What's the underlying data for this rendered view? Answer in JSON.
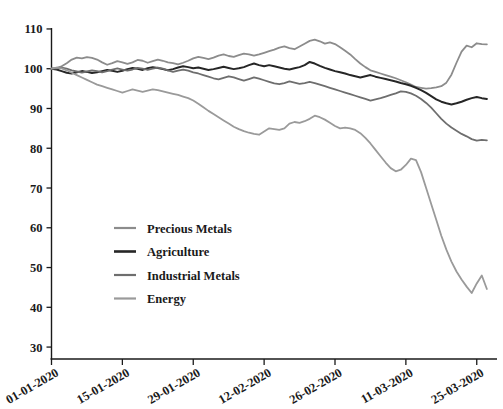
{
  "chart_data": {
    "type": "line",
    "title": "",
    "subtitle": "",
    "xlabel": "",
    "ylabel": "",
    "ylim": [
      27,
      112
    ],
    "yticks": [
      30,
      40,
      50,
      60,
      70,
      80,
      90,
      100,
      110
    ],
    "ytick_labels": [
      "30",
      "40",
      "50",
      "60",
      "70",
      "80",
      "90",
      "100",
      "110"
    ],
    "xticks": [
      0,
      14,
      28,
      42,
      56,
      70,
      84
    ],
    "xtick_labels": [
      "01-01-2020",
      "15-01-2020",
      "29-01-2020",
      "12-02-2020",
      "26-02-2020",
      "11-03-2020",
      "25-03-2020"
    ],
    "xlim": [
      0,
      88
    ],
    "grid": false,
    "legend_position": "center-left",
    "x_values": [
      0,
      1,
      2,
      3,
      4,
      5,
      6,
      7,
      8,
      9,
      10,
      11,
      12,
      13,
      14,
      15,
      16,
      17,
      18,
      19,
      20,
      21,
      22,
      23,
      24,
      25,
      26,
      27,
      28,
      29,
      30,
      31,
      32,
      33,
      34,
      35,
      36,
      37,
      38,
      39,
      40,
      41,
      42,
      43,
      44,
      45,
      46,
      47,
      48,
      49,
      50,
      51,
      52,
      53,
      54,
      55,
      56,
      57,
      58,
      59,
      60,
      61,
      62,
      63,
      64,
      65,
      66,
      67,
      68,
      69,
      70,
      71,
      72,
      73,
      74,
      75,
      76,
      77,
      78,
      79,
      80,
      81,
      82,
      83,
      84,
      85,
      86
    ],
    "series": [
      {
        "name": "Precious Metals",
        "color": "#8c8c8c",
        "values": [
          100.0,
          100.2,
          100.6,
          101.4,
          102.3,
          102.8,
          102.6,
          102.9,
          102.7,
          102.3,
          101.6,
          101.0,
          101.4,
          101.9,
          101.6,
          101.2,
          101.6,
          102.2,
          102.0,
          101.5,
          101.9,
          102.3,
          102.0,
          101.6,
          101.4,
          101.1,
          101.5,
          102.0,
          102.6,
          103.0,
          102.7,
          102.4,
          102.8,
          103.3,
          103.6,
          103.2,
          103.0,
          103.4,
          103.8,
          103.6,
          103.3,
          103.6,
          104.0,
          104.4,
          104.8,
          105.3,
          105.6,
          105.2,
          104.9,
          105.6,
          106.3,
          107.0,
          107.3,
          106.9,
          106.3,
          106.6,
          106.2,
          105.4,
          104.5,
          103.6,
          102.4,
          101.3,
          100.4,
          99.6,
          99.2,
          98.8,
          98.4,
          98.0,
          97.6,
          97.1,
          96.6,
          96.0,
          95.4,
          95.2,
          95.0,
          95.1,
          95.3,
          95.6,
          96.5,
          98.5,
          101.5,
          104.3,
          105.8,
          105.4,
          106.4,
          106.2,
          106.1
        ]
      },
      {
        "name": "Agriculture",
        "color": "#262626",
        "values": [
          100.0,
          99.8,
          99.4,
          99.0,
          98.8,
          99.1,
          99.4,
          99.2,
          98.9,
          99.1,
          99.4,
          99.7,
          99.5,
          99.2,
          99.5,
          99.9,
          100.2,
          100.0,
          99.7,
          100.1,
          100.4,
          100.2,
          99.9,
          99.6,
          99.9,
          100.3,
          100.6,
          100.4,
          100.1,
          100.3,
          100.0,
          99.7,
          99.9,
          100.2,
          100.5,
          100.2,
          99.9,
          100.1,
          100.4,
          100.9,
          101.3,
          100.9,
          100.6,
          100.9,
          100.6,
          100.3,
          100.0,
          99.8,
          100.1,
          100.4,
          100.9,
          101.7,
          101.3,
          100.7,
          100.2,
          99.8,
          99.4,
          99.1,
          98.8,
          98.4,
          98.1,
          97.8,
          98.1,
          98.4,
          98.0,
          97.7,
          97.4,
          97.1,
          96.8,
          96.4,
          96.1,
          95.7,
          95.2,
          94.6,
          93.9,
          93.1,
          92.3,
          91.7,
          91.3,
          91.0,
          91.3,
          91.7,
          92.2,
          92.6,
          92.9,
          92.6,
          92.4
        ]
      },
      {
        "name": "Industrial Metals",
        "color": "#6e6e6e",
        "values": [
          100.0,
          100.1,
          100.3,
          100.0,
          99.6,
          99.3,
          99.0,
          99.3,
          99.6,
          99.4,
          99.1,
          99.4,
          99.8,
          100.1,
          99.8,
          99.5,
          99.8,
          100.2,
          100.0,
          99.7,
          100.0,
          100.3,
          100.0,
          99.6,
          99.2,
          99.5,
          99.8,
          99.5,
          99.1,
          98.8,
          98.4,
          98.0,
          97.6,
          97.3,
          97.7,
          98.1,
          97.8,
          97.4,
          97.0,
          97.4,
          97.8,
          97.5,
          97.1,
          96.7,
          96.3,
          96.1,
          96.4,
          96.8,
          96.5,
          96.2,
          96.4,
          96.7,
          96.4,
          96.0,
          95.6,
          95.2,
          94.8,
          94.4,
          94.0,
          93.6,
          93.2,
          92.8,
          92.4,
          92.0,
          92.3,
          92.6,
          93.0,
          93.4,
          93.8,
          94.3,
          94.2,
          93.8,
          93.2,
          92.4,
          91.4,
          90.2,
          88.8,
          87.4,
          86.2,
          85.2,
          84.4,
          83.6,
          83.0,
          82.3,
          81.9,
          82.1,
          82.0
        ]
      },
      {
        "name": "Energy",
        "color": "#9a9a9a",
        "values": [
          100.0,
          100.3,
          100.1,
          99.6,
          99.0,
          98.4,
          97.8,
          97.2,
          96.6,
          96.0,
          95.6,
          95.2,
          94.8,
          94.4,
          94.0,
          94.4,
          94.8,
          94.5,
          94.2,
          94.5,
          94.8,
          94.6,
          94.3,
          94.0,
          93.7,
          93.4,
          93.0,
          92.6,
          92.0,
          91.2,
          90.3,
          89.4,
          88.6,
          87.8,
          87.0,
          86.2,
          85.4,
          84.8,
          84.3,
          83.9,
          83.6,
          83.4,
          84.2,
          85.0,
          84.8,
          84.6,
          85.0,
          86.2,
          86.6,
          86.4,
          86.8,
          87.4,
          88.2,
          87.8,
          87.2,
          86.4,
          85.6,
          85.0,
          85.2,
          85.0,
          84.6,
          83.8,
          82.6,
          81.2,
          79.6,
          78.0,
          76.4,
          75.0,
          74.2,
          74.6,
          75.8,
          77.4,
          77.0,
          74.0,
          70.0,
          66.0,
          62.0,
          58.0,
          54.5,
          51.5,
          49.0,
          47.0,
          45.2,
          43.6,
          46.0,
          48.0,
          44.6
        ]
      }
    ]
  },
  "legend": {
    "entries": [
      {
        "label": "Precious Metals"
      },
      {
        "label": "Agriculture"
      },
      {
        "label": "Industrial Metals"
      },
      {
        "label": "Energy"
      }
    ]
  }
}
